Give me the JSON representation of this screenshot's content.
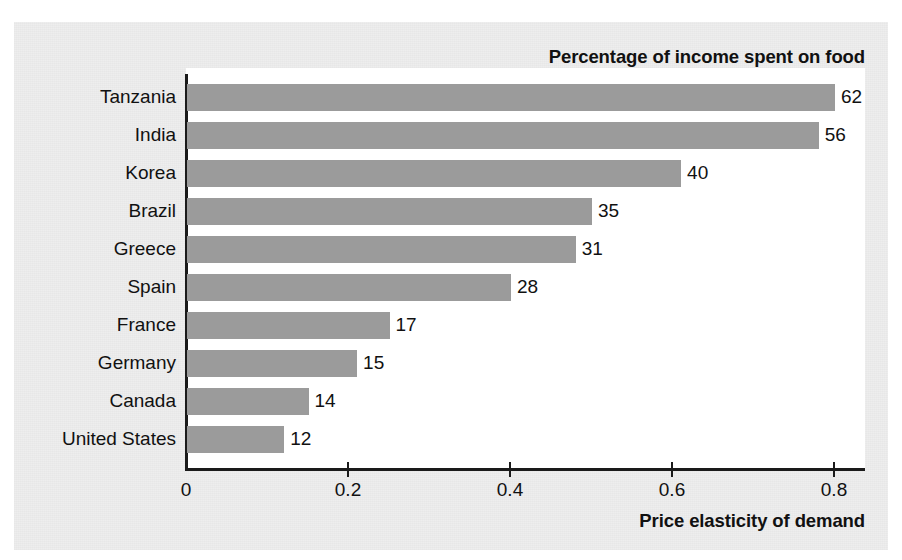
{
  "chart_data": {
    "type": "bar",
    "orientation": "horizontal",
    "title": "Percentage of income spent on food",
    "xlabel": "Price elasticity of demand",
    "ylabel": "",
    "grid": false,
    "legend": null,
    "xlim": [
      0,
      0.88
    ],
    "xticks": [
      "0",
      "0.2",
      "0.4",
      "0.6",
      "0.8"
    ],
    "xtick_values": [
      0,
      0.2,
      0.4,
      0.6,
      0.8
    ],
    "categories": [
      "Tanzania",
      "India",
      "Korea",
      "Brazil",
      "Greece",
      "Spain",
      "France",
      "Germany",
      "Canada",
      "United States"
    ],
    "values": [
      0.8,
      0.78,
      0.61,
      0.5,
      0.48,
      0.4,
      0.25,
      0.21,
      0.15,
      0.12
    ],
    "bar_labels": [
      "62",
      "56",
      "40",
      "35",
      "31",
      "28",
      "17",
      "15",
      "14",
      "12"
    ],
    "bar_label_meaning": "Percentage of income spent on food",
    "bar_color": "#9b9b9b",
    "axis_color": "#1a1a1a",
    "plot_background": "#ffffff",
    "panel_background": "#eeeeee",
    "rows": [
      {
        "category": "Tanzania",
        "elasticity": 0.8,
        "pct_income_food": "62"
      },
      {
        "category": "India",
        "elasticity": 0.78,
        "pct_income_food": "56"
      },
      {
        "category": "Korea",
        "elasticity": 0.61,
        "pct_income_food": "40"
      },
      {
        "category": "Brazil",
        "elasticity": 0.5,
        "pct_income_food": "35"
      },
      {
        "category": "Greece",
        "elasticity": 0.48,
        "pct_income_food": "31"
      },
      {
        "category": "Spain",
        "elasticity": 0.4,
        "pct_income_food": "28"
      },
      {
        "category": "France",
        "elasticity": 0.25,
        "pct_income_food": "17"
      },
      {
        "category": "Germany",
        "elasticity": 0.21,
        "pct_income_food": "15"
      },
      {
        "category": "Canada",
        "elasticity": 0.15,
        "pct_income_food": "14"
      },
      {
        "category": "United States",
        "elasticity": 0.12,
        "pct_income_food": "12"
      }
    ]
  }
}
